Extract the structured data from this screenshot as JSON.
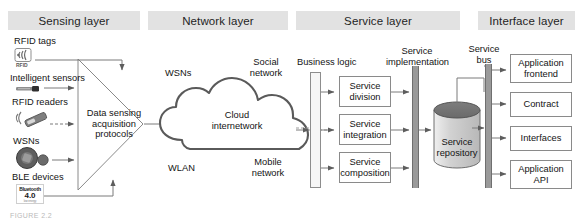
{
  "figure": {
    "caption": "FIGURE 2.2"
  },
  "layers": [
    {
      "id": "sensing",
      "title": "Sensing layer",
      "x": 8,
      "y": 11,
      "w": 132
    },
    {
      "id": "network",
      "title": "Network layer",
      "x": 148,
      "y": 11,
      "w": 140
    },
    {
      "id": "service",
      "title": "Service layer",
      "x": 296,
      "y": 11,
      "w": 164
    },
    {
      "id": "interface",
      "title": "Interface layer",
      "x": 478,
      "y": 11,
      "w": 97
    }
  ],
  "sensing": {
    "devices": [
      {
        "label": "RFID tags",
        "icon": "rfid-tag-icon",
        "icon_caption": "RFID"
      },
      {
        "label": "Intelligent sensors",
        "icon": "sensor-bar-icon"
      },
      {
        "label": "RFID readers",
        "icon": "rfid-reader-icon"
      },
      {
        "label": "WSNs",
        "icon": "wsn-node-icon"
      },
      {
        "label": "BLE devices",
        "icon": "bluetooth-badge-icon",
        "badge_name": "Bluetooth",
        "badge_version": "4.0",
        "badge_tiny": "low energy"
      }
    ],
    "funnel": {
      "line1": "Data sensing",
      "line2": "acquisition",
      "line3": "protocols"
    }
  },
  "network": {
    "cloud": {
      "line1": "Cloud",
      "line2": "internetwork"
    },
    "around": [
      {
        "label": "WSNs"
      },
      {
        "label": "Social network"
      },
      {
        "label": "WLAN"
      },
      {
        "label": "Mobile network"
      }
    ]
  },
  "service": {
    "business_logic_label": "Business logic",
    "implementation_label": "Service implementation",
    "blocks": [
      {
        "line1": "Service",
        "line2": "division"
      },
      {
        "line1": "Service",
        "line2": "integration"
      },
      {
        "line1": "Service",
        "line2": "composition"
      }
    ],
    "repository": {
      "line1": "Service",
      "line2": "repository"
    }
  },
  "interface": {
    "bus_label": "Service bus",
    "boxes": [
      {
        "line1": "Application",
        "line2": "frontend"
      },
      {
        "line1": "Contract",
        "line2": ""
      },
      {
        "line1": "Interfaces",
        "line2": ""
      },
      {
        "line1": "Application",
        "line2": "API"
      }
    ]
  },
  "colors": {
    "header_bg": "#e2e2e2",
    "stroke": "#6f6f6f",
    "box_stroke": "#8a8a8a",
    "bar_fill": "#9a9a9a",
    "cylinder_top": "#6e6e6e",
    "cylinder_body": "#d6d6d6",
    "text": "#141414"
  }
}
